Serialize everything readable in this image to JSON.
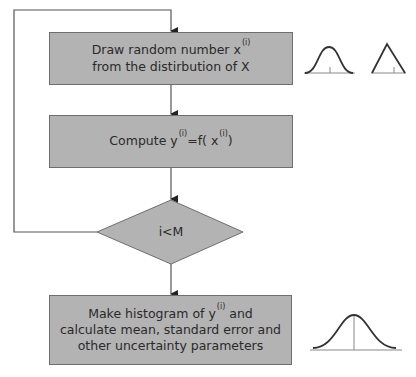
{
  "diagram": {
    "type": "flowchart",
    "colors": {
      "box_fill": "#b3b3b3",
      "box_border": "#6e6e6e",
      "line": "#555555",
      "text": "#2a2a2a"
    },
    "steps": [
      {
        "id": "draw",
        "line1_pre": "Draw random number x",
        "line1_sup": "(i)",
        "line2": "from the distirbution of X"
      },
      {
        "id": "compute",
        "pre": "Compute y",
        "sup1": "(i)",
        "mid": "=f( x",
        "sup2": "(i)",
        "post": ")"
      },
      {
        "id": "decision",
        "label": "i<M"
      },
      {
        "id": "histogram",
        "line1_pre": "Make histogram of  y",
        "line1_sup": "(i)",
        "line1_post": " and",
        "line2": "calculate mean, standard error and",
        "line3": "other uncertainty parameters"
      }
    ],
    "icons": [
      "normal-distribution-icon",
      "triangular-distribution-icon",
      "output-distribution-icon"
    ]
  }
}
